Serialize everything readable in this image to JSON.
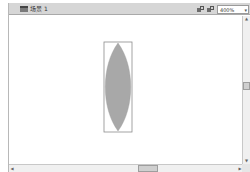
{
  "scene_bar": {
    "scene_label": "场景 1",
    "scene_icon": "clapboard-icon",
    "edit_symbols_icon": "edit-symbols-icon",
    "edit_scene_icon": "edit-scene-icon",
    "zoom_value": "400%",
    "zoom_dropdown_icon": "chevron-down-icon"
  },
  "stage": {
    "shape": {
      "type": "lens-oval",
      "fill_color": "#a8a8a8",
      "selection_box_color": "#8c8c8c"
    },
    "background_color": "#ffffff"
  },
  "scrollbars": {
    "vertical_up_arrow": "▲",
    "vertical_down_arrow": "▼",
    "horizontal_left_arrow": "◀",
    "horizontal_right_arrow": "▶"
  }
}
